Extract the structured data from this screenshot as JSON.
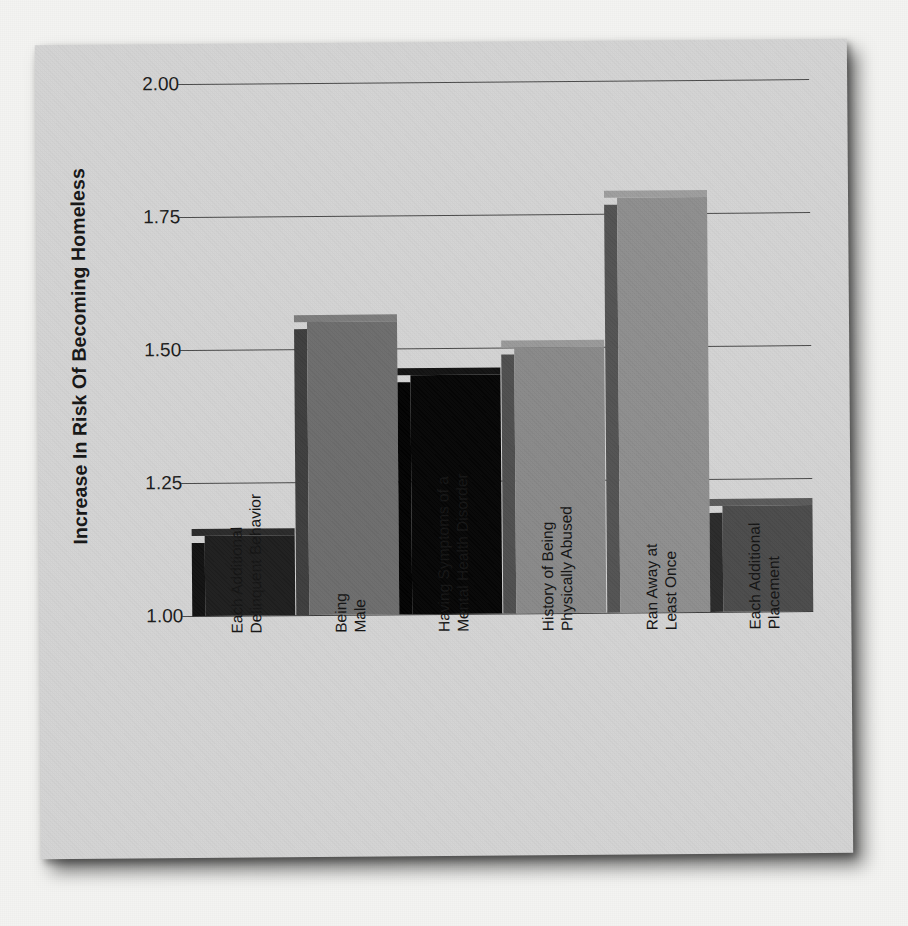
{
  "figure": {
    "background_color": "#d4d4d4",
    "page_color": "#f4f4f2"
  },
  "chart_data": {
    "type": "bar",
    "title": "",
    "xlabel": "",
    "ylabel": "Increase In Risk Of Becoming Homeless",
    "ylim": [
      1.0,
      2.0
    ],
    "yticks": [
      "1.00",
      "1.25",
      "1.50",
      "1.75",
      "2.00"
    ],
    "ytick_values": [
      1.0,
      1.25,
      1.5,
      1.75,
      2.0
    ],
    "grid": true,
    "legend": "none",
    "categories": [
      "Each Additional Delinquent Behavior",
      "Being Male",
      "Having Symptoms of a Mental Health Disorder",
      "History of Being Physically Abused",
      "Ran Away at Least Once",
      "Each Additional Placement"
    ],
    "category_lines": [
      [
        "Each Additional",
        "Delinquent Behavior"
      ],
      [
        "Being",
        "Male"
      ],
      [
        "Having Symptoms of a",
        "Mental Health Disorder"
      ],
      [
        "History of Being",
        "Physically Abused"
      ],
      [
        "Ran Away at",
        "Least Once"
      ],
      [
        "Each Additional",
        "Placement"
      ]
    ],
    "values": [
      1.15,
      1.55,
      1.45,
      1.5,
      1.78,
      1.2
    ],
    "bar_colors": [
      "#1e1e1e",
      "#6d6d6d",
      "#050505",
      "#8a8a8a",
      "#8f8f8f",
      "#4b4b4b"
    ],
    "bar_side_colors": [
      "#111111",
      "#3e3e3e",
      "#020202",
      "#4f4f4f",
      "#535353",
      "#2a2a2a"
    ],
    "bar_top_colors": [
      "#2a2a2a",
      "#7c7c7c",
      "#121212",
      "#9a9a9a",
      "#9e9e9e",
      "#5a5a5a"
    ]
  }
}
